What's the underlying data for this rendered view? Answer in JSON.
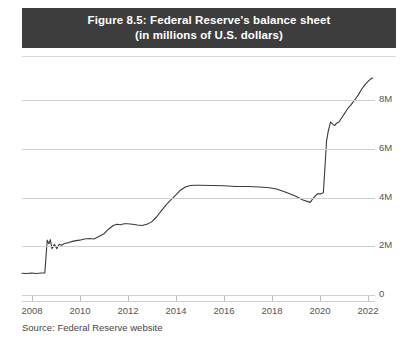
{
  "figure": {
    "title_line1": "Figure 8.5: Federal Reserve's balance sheet",
    "title_line2": "(in millions of U.S. dollars)",
    "source_note": "Source: Federal Reserve website",
    "title_bar_color": "#3d3d3d",
    "title_text_color": "#ffffff",
    "grid_color": "#cfcfcf",
    "line_color": "#3a3a3a",
    "background_color": "#ffffff"
  },
  "chart_data": {
    "type": "line",
    "title": "Figure 8.5: Federal Reserve's balance sheet (in millions of U.S. dollars)",
    "subtitle": "(in millions of U.S. dollars)",
    "xlabel": "",
    "ylabel": "",
    "unit": "millions of U.S. dollars",
    "grid": true,
    "grid_axis": "y",
    "legend": "none",
    "y_axis_position": "right",
    "xlim": [
      2007.6,
      2022.3
    ],
    "ylim": [
      0,
      9200000
    ],
    "xticks": [
      2008,
      2010,
      2012,
      2014,
      2016,
      2018,
      2020,
      2022
    ],
    "xticklabels": [
      "2008",
      "2010",
      "2012",
      "2014",
      "2016",
      "2018",
      "2020",
      "2022"
    ],
    "yticks": [
      0,
      2000000,
      4000000,
      6000000,
      8000000
    ],
    "yticklabels": [
      "0",
      "2M",
      "4M",
      "6M",
      "8M"
    ],
    "series": [
      {
        "name": "Federal Reserve total assets",
        "x": [
          2007.6,
          2007.8,
          2008.0,
          2008.2,
          2008.4,
          2008.55,
          2008.65,
          2008.72,
          2008.78,
          2008.85,
          2008.95,
          2009.05,
          2009.15,
          2009.25,
          2009.35,
          2009.45,
          2009.55,
          2009.7,
          2009.85,
          2010.0,
          2010.2,
          2010.4,
          2010.6,
          2010.8,
          2011.0,
          2011.2,
          2011.4,
          2011.55,
          2011.7,
          2011.85,
          2012.0,
          2012.2,
          2012.4,
          2012.6,
          2012.8,
          2013.0,
          2013.2,
          2013.4,
          2013.6,
          2013.8,
          2014.0,
          2014.2,
          2014.4,
          2014.6,
          2014.8,
          2015.0,
          2015.5,
          2016.0,
          2016.5,
          2017.0,
          2017.5,
          2017.9,
          2018.2,
          2018.5,
          2018.8,
          2019.0,
          2019.3,
          2019.6,
          2019.75,
          2019.9,
          2020.05,
          2020.15,
          2020.22,
          2020.28,
          2020.35,
          2020.45,
          2020.55,
          2020.62,
          2020.7,
          2020.8,
          2020.9,
          2021.0,
          2021.1,
          2021.2,
          2021.3,
          2021.45,
          2021.6,
          2021.75,
          2021.9,
          2022.0,
          2022.1,
          2022.2
        ],
        "y": [
          890000,
          880000,
          900000,
          880000,
          900000,
          905000,
          2250000,
          2100000,
          2270000,
          1900000,
          2080000,
          1900000,
          2080000,
          2040000,
          2100000,
          2130000,
          2150000,
          2200000,
          2230000,
          2250000,
          2300000,
          2320000,
          2300000,
          2400000,
          2500000,
          2700000,
          2850000,
          2900000,
          2880000,
          2920000,
          2920000,
          2900000,
          2870000,
          2850000,
          2900000,
          3000000,
          3200000,
          3450000,
          3700000,
          3900000,
          4100000,
          4300000,
          4430000,
          4490000,
          4500000,
          4500000,
          4490000,
          4480000,
          4450000,
          4450000,
          4430000,
          4400000,
          4350000,
          4250000,
          4130000,
          4050000,
          3900000,
          3800000,
          4000000,
          4150000,
          4150000,
          4200000,
          5300000,
          6300000,
          6700000,
          7100000,
          7000000,
          6950000,
          7050000,
          7100000,
          7250000,
          7400000,
          7550000,
          7700000,
          7800000,
          8000000,
          8200000,
          8450000,
          8650000,
          8750000,
          8850000,
          8900000
        ]
      }
    ],
    "annotations": [
      {
        "label": "2008 financial crisis asset surge",
        "x": 2008.65,
        "y": 2250000
      },
      {
        "label": "QE3 expansion",
        "x": 2014.0,
        "y": 4100000
      },
      {
        "label": "COVID-19 balance sheet expansion",
        "x": 2020.3,
        "y": 7000000
      }
    ]
  }
}
